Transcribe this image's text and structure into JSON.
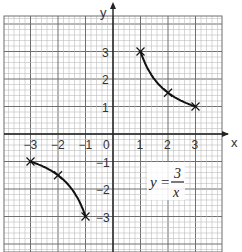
{
  "chart_data": {
    "type": "line",
    "title": "",
    "equation": {
      "lhs": "y",
      "eq": "=",
      "numerator": "3",
      "denominator": "x"
    },
    "xlabel": "x",
    "ylabel": "y",
    "xlim": [
      -4,
      4
    ],
    "ylim": [
      -4.2,
      4.2
    ],
    "grid": true,
    "x_ticks": [
      "-3",
      "-2",
      "-1",
      "0",
      "1",
      "2",
      "3"
    ],
    "y_ticks": [
      "3",
      "2",
      "1",
      "-1",
      "-2",
      "-3"
    ],
    "series": [
      {
        "name": "y = 3/x (x>0)",
        "points": [
          [
            1,
            3
          ],
          [
            2,
            1.5
          ],
          [
            3,
            1
          ]
        ]
      },
      {
        "name": "y = 3/x (x<0)",
        "points": [
          [
            -3,
            -1
          ],
          [
            -2,
            -1.5
          ],
          [
            -1,
            -3
          ]
        ]
      }
    ]
  },
  "colors": {
    "grid_minor": "#bdbdbd",
    "grid_major": "#6e6e6e",
    "axis": "#222222",
    "curve": "#111111"
  }
}
